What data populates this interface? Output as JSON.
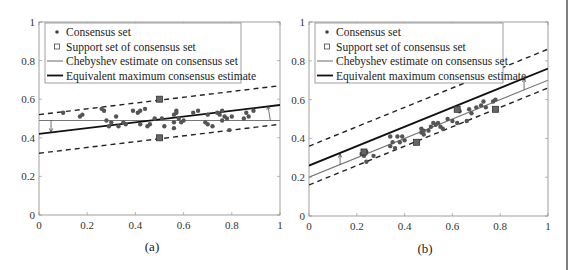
{
  "legend": {
    "consensus": "Consensus set",
    "support": "Support set of consensus set",
    "chebyshev": "Chebyshev estimate on consensus set",
    "equivalent": "Equivalent maximum consensus estimate"
  },
  "chart_data": [
    {
      "type": "scatter",
      "caption": "(a)",
      "xlim": [
        0,
        1
      ],
      "ylim": [
        0,
        1
      ],
      "xticks": [
        "0",
        "0.2",
        "0.4",
        "0.6",
        "0.8",
        "1"
      ],
      "yticks": [
        "0",
        "0.2",
        "0.4",
        "0.6",
        "0.8",
        "1"
      ],
      "legend_position": "upper-left",
      "lines": {
        "chebyshev": [
          [
            0,
            0.49
          ],
          [
            1,
            0.49
          ]
        ],
        "equivalent": [
          [
            0,
            0.42
          ],
          [
            1,
            0.57
          ]
        ],
        "dashed_upper": [
          [
            0,
            0.52
          ],
          [
            1,
            0.67
          ]
        ],
        "dashed_lower": [
          [
            0,
            0.32
          ],
          [
            1,
            0.47
          ]
        ]
      },
      "support_points": [
        [
          0.5,
          0.6
        ],
        [
          0.5,
          0.4
        ]
      ],
      "arrows": [
        [
          0.05,
          0.49,
          0.05,
          0.43
        ],
        [
          0.96,
          0.49,
          0.95,
          0.565
        ]
      ],
      "points": [
        [
          0.1,
          0.53
        ],
        [
          0.17,
          0.51
        ],
        [
          0.18,
          0.52
        ],
        [
          0.26,
          0.55
        ],
        [
          0.27,
          0.54
        ],
        [
          0.28,
          0.49
        ],
        [
          0.29,
          0.46
        ],
        [
          0.3,
          0.48
        ],
        [
          0.32,
          0.51
        ],
        [
          0.33,
          0.46
        ],
        [
          0.35,
          0.48
        ],
        [
          0.36,
          0.47
        ],
        [
          0.39,
          0.54
        ],
        [
          0.41,
          0.53
        ],
        [
          0.42,
          0.54
        ],
        [
          0.42,
          0.47
        ],
        [
          0.44,
          0.55
        ],
        [
          0.45,
          0.46
        ],
        [
          0.46,
          0.47
        ],
        [
          0.48,
          0.5
        ],
        [
          0.51,
          0.5
        ],
        [
          0.52,
          0.46
        ],
        [
          0.56,
          0.52
        ],
        [
          0.56,
          0.48
        ],
        [
          0.56,
          0.45
        ],
        [
          0.57,
          0.54
        ],
        [
          0.57,
          0.53
        ],
        [
          0.58,
          0.5
        ],
        [
          0.59,
          0.48
        ],
        [
          0.6,
          0.49
        ],
        [
          0.64,
          0.53
        ],
        [
          0.66,
          0.54
        ],
        [
          0.69,
          0.48
        ],
        [
          0.7,
          0.52
        ],
        [
          0.7,
          0.47
        ],
        [
          0.72,
          0.46
        ],
        [
          0.74,
          0.53
        ],
        [
          0.75,
          0.52
        ],
        [
          0.76,
          0.54
        ],
        [
          0.76,
          0.49
        ],
        [
          0.77,
          0.51
        ],
        [
          0.78,
          0.5
        ],
        [
          0.79,
          0.44
        ],
        [
          0.8,
          0.51
        ],
        [
          0.85,
          0.5
        ],
        [
          0.86,
          0.53
        ],
        [
          0.87,
          0.51
        ],
        [
          0.89,
          0.54
        ]
      ]
    },
    {
      "type": "scatter",
      "caption": "(b)",
      "xlim": [
        0,
        1
      ],
      "ylim": [
        0,
        1
      ],
      "xticks": [
        "0",
        "0.2",
        "0.4",
        "0.6",
        "0.8",
        "1"
      ],
      "yticks": [
        "0",
        "0.2",
        "0.4",
        "0.6",
        "0.8",
        "1"
      ],
      "legend_position": "upper-left",
      "lines": {
        "chebyshev": [
          [
            0,
            0.2
          ],
          [
            1,
            0.7
          ]
        ],
        "equivalent": [
          [
            0,
            0.26
          ],
          [
            1,
            0.76
          ]
        ],
        "dashed_upper": [
          [
            0,
            0.36
          ],
          [
            1,
            0.86
          ]
        ],
        "dashed_lower": [
          [
            0,
            0.16
          ],
          [
            1,
            0.66
          ]
        ]
      },
      "support_points": [
        [
          0.23,
          0.33
        ],
        [
          0.45,
          0.38
        ],
        [
          0.62,
          0.55
        ],
        [
          0.78,
          0.55
        ]
      ],
      "arrows": [
        [
          0.13,
          0.265,
          0.13,
          0.32
        ],
        [
          0.9,
          0.65,
          0.9,
          0.71
        ]
      ],
      "points": [
        [
          0.22,
          0.32
        ],
        [
          0.23,
          0.31
        ],
        [
          0.24,
          0.33
        ],
        [
          0.24,
          0.28
        ],
        [
          0.27,
          0.31
        ],
        [
          0.34,
          0.36
        ],
        [
          0.34,
          0.41
        ],
        [
          0.35,
          0.38
        ],
        [
          0.36,
          0.35
        ],
        [
          0.37,
          0.41
        ],
        [
          0.38,
          0.38
        ],
        [
          0.39,
          0.41
        ],
        [
          0.4,
          0.39
        ],
        [
          0.47,
          0.45
        ],
        [
          0.47,
          0.43
        ],
        [
          0.48,
          0.44
        ],
        [
          0.48,
          0.42
        ],
        [
          0.5,
          0.44
        ],
        [
          0.51,
          0.46
        ],
        [
          0.52,
          0.48
        ],
        [
          0.53,
          0.47
        ],
        [
          0.54,
          0.48
        ],
        [
          0.55,
          0.46
        ],
        [
          0.56,
          0.45
        ],
        [
          0.58,
          0.5
        ],
        [
          0.6,
          0.49
        ],
        [
          0.62,
          0.48
        ],
        [
          0.63,
          0.54
        ],
        [
          0.66,
          0.49
        ],
        [
          0.67,
          0.55
        ],
        [
          0.68,
          0.53
        ],
        [
          0.7,
          0.56
        ],
        [
          0.72,
          0.57
        ],
        [
          0.73,
          0.59
        ],
        [
          0.74,
          0.56
        ],
        [
          0.77,
          0.59
        ],
        [
          0.78,
          0.6
        ]
      ]
    }
  ]
}
